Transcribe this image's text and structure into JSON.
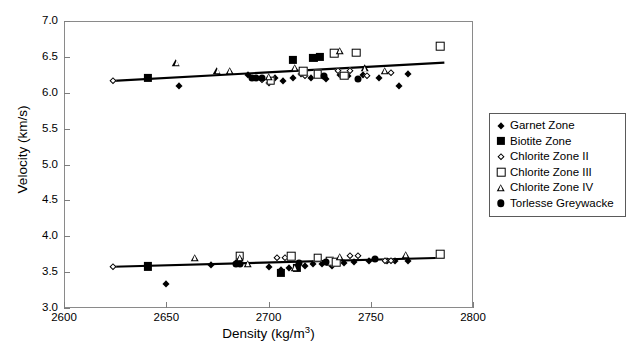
{
  "chart_data": {
    "type": "scatter",
    "title": "",
    "xlabel": "Density (kg/m3)",
    "xlabel_base": "Density (kg/m",
    "xlabel_sup": "3",
    "xlabel_tail": ")",
    "ylabel": "Velocity (km/s)",
    "xlim": [
      2600,
      2800
    ],
    "ylim": [
      3.0,
      7.0
    ],
    "xticks": [
      2600,
      2650,
      2700,
      2750,
      2800
    ],
    "xtick_labels": [
      "2600",
      "2650",
      "2700",
      "2750",
      "2800"
    ],
    "yticks": [
      3.0,
      3.5,
      4.0,
      4.5,
      5.0,
      5.5,
      6.0,
      6.5,
      7.0
    ],
    "ytick_labels": [
      "3.0",
      "3.5",
      "4.0",
      "4.5",
      "5.0",
      "5.5",
      "6.0",
      "6.5",
      "7.0"
    ],
    "grid": false,
    "legend_position": "right-outside",
    "legend": [
      {
        "label": "Garnet Zone",
        "marker": "filled-diamond",
        "color": "#000000"
      },
      {
        "label": "Biotite Zone",
        "marker": "filled-square",
        "color": "#000000"
      },
      {
        "label": "Chlorite Zone II",
        "marker": "open-diamond",
        "color": "#000000"
      },
      {
        "label": "Chlorite Zone III",
        "marker": "open-square",
        "color": "#000000"
      },
      {
        "label": "Chlorite Zone IV",
        "marker": "open-triangle",
        "color": "#000000"
      },
      {
        "label": "Torlesse Greywacke",
        "marker": "filled-circle",
        "color": "#000000"
      }
    ],
    "trend_lines": [
      {
        "name": "Vp-trend",
        "x": [
          2624,
          2786
        ],
        "y": [
          6.165,
          6.42
        ],
        "color": "#000000",
        "width": 2.2
      },
      {
        "name": "Vs-trend",
        "x": [
          2624,
          2786
        ],
        "y": [
          3.575,
          3.7
        ],
        "color": "#000000",
        "width": 2.2
      }
    ],
    "series": [
      {
        "name": "Garnet Zone",
        "marker": "filled-diamond",
        "points": [
          [
            2656,
            6.09
          ],
          [
            2690,
            6.25
          ],
          [
            2700,
            6.13
          ],
          [
            2703,
            6.2
          ],
          [
            2707,
            6.17
          ],
          [
            2712,
            6.2
          ],
          [
            2716,
            6.26
          ],
          [
            2721,
            6.21
          ],
          [
            2728,
            6.19
          ],
          [
            2735,
            6.25
          ],
          [
            2739,
            6.23
          ],
          [
            2746,
            6.25
          ],
          [
            2754,
            6.21
          ],
          [
            2764,
            6.09
          ],
          [
            2768,
            6.26
          ],
          [
            2650,
            3.33
          ],
          [
            2672,
            3.6
          ],
          [
            2684,
            3.63
          ],
          [
            2700,
            3.57
          ],
          [
            2706,
            3.53
          ],
          [
            2710,
            3.56
          ],
          [
            2714,
            3.57
          ],
          [
            2718,
            3.58
          ],
          [
            2722,
            3.62
          ],
          [
            2726,
            3.61
          ],
          [
            2731,
            3.58
          ],
          [
            2737,
            3.63
          ],
          [
            2742,
            3.64
          ],
          [
            2749,
            3.66
          ],
          [
            2758,
            3.66
          ],
          [
            2762,
            3.65
          ],
          [
            2768,
            3.66
          ]
        ]
      },
      {
        "name": "Biotite Zone",
        "marker": "filled-square",
        "points": [
          [
            2641,
            6.21
          ],
          [
            2712,
            6.46
          ],
          [
            2722,
            6.49
          ],
          [
            2725,
            6.5
          ],
          [
            2641,
            3.58
          ],
          [
            2706,
            3.49
          ],
          [
            2714,
            3.56
          ]
        ]
      },
      {
        "name": "Chlorite Zone II",
        "marker": "open-diamond",
        "points": [
          [
            2624,
            6.17
          ],
          [
            2697,
            6.18
          ],
          [
            2718,
            6.24
          ],
          [
            2734,
            6.31
          ],
          [
            2740,
            6.3
          ],
          [
            2748,
            6.24
          ],
          [
            2760,
            6.27
          ],
          [
            2624,
            3.575
          ],
          [
            2704,
            3.69
          ],
          [
            2708,
            3.7
          ],
          [
            2740,
            3.72
          ],
          [
            2744,
            3.73
          ],
          [
            2757,
            3.65
          ],
          [
            2760,
            3.66
          ]
        ]
      },
      {
        "name": "Chlorite Zone III",
        "marker": "open-square",
        "points": [
          [
            2701,
            6.17
          ],
          [
            2717,
            6.3
          ],
          [
            2724,
            6.26
          ],
          [
            2732,
            6.55
          ],
          [
            2737,
            6.24
          ],
          [
            2743,
            6.56
          ],
          [
            2784,
            6.65
          ],
          [
            2686,
            3.73
          ],
          [
            2711,
            3.72
          ],
          [
            2724,
            3.7
          ],
          [
            2730,
            3.65
          ],
          [
            2733,
            3.64
          ],
          [
            2784,
            3.75
          ]
        ]
      },
      {
        "name": "Chlorite Zone IV",
        "marker": "open-triangle",
        "points": [
          [
            2655,
            6.42
          ],
          [
            2675,
            6.31
          ],
          [
            2681,
            6.31
          ],
          [
            2700,
            6.22
          ],
          [
            2713,
            6.35
          ],
          [
            2735,
            6.58
          ],
          [
            2747,
            6.34
          ],
          [
            2757,
            6.3
          ],
          [
            2664,
            3.7
          ],
          [
            2686,
            3.7
          ],
          [
            2690,
            3.62
          ],
          [
            2713,
            3.56
          ],
          [
            2735,
            3.71
          ],
          [
            2767,
            3.74
          ]
        ]
      },
      {
        "name": "Torlesse Greywacke",
        "marker": "filled-circle",
        "points": [
          [
            2692,
            6.21
          ],
          [
            2694,
            6.2
          ],
          [
            2697,
            6.21
          ],
          [
            2727,
            6.23
          ],
          [
            2744,
            6.19
          ],
          [
            2684,
            3.62
          ],
          [
            2686,
            3.62
          ],
          [
            2715,
            3.63
          ],
          [
            2728,
            3.64
          ],
          [
            2752,
            3.68
          ]
        ]
      }
    ]
  }
}
